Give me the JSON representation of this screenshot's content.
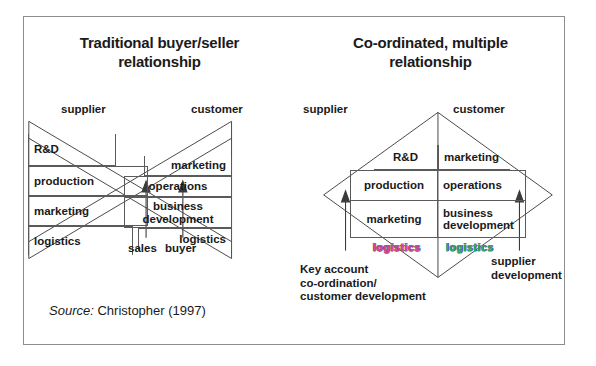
{
  "figure": {
    "source_label": "Source:",
    "source_text": "Christopher (1997)"
  },
  "left_panel": {
    "title": "Traditional buyer/seller relationship",
    "title_line1": "Traditional buyer/seller",
    "title_line2": "relationship",
    "supplier_label": "supplier",
    "customer_label": "customer",
    "supplier_functions": [
      "R&D",
      "production",
      "marketing",
      "logistics"
    ],
    "customer_functions": [
      "marketing",
      "operations",
      "business development",
      "logistics"
    ],
    "customer_function_3_line1": "business",
    "customer_function_3_line2": "development",
    "arrows": [
      {
        "label": "sales"
      },
      {
        "label": "buyer"
      }
    ]
  },
  "right_panel": {
    "title": "Co-ordinated, multiple relationship",
    "title_line1": "Co-ordinated, multiple",
    "title_line2": "relationship",
    "supplier_label": "supplier",
    "customer_label": "customer",
    "supplier_functions": [
      "R&D",
      "production",
      "marketing",
      "logistics"
    ],
    "customer_functions": [
      "marketing",
      "operations",
      "business development",
      "logistics"
    ],
    "customer_function_3_line1": "business",
    "customer_function_3_line2": "development",
    "supplier_logistics": "logistics",
    "customer_logistics": "logistics",
    "arrows": [
      {
        "label_line1": "Key account",
        "label_line2": "co-ordination/",
        "label_line3": "customer development"
      },
      {
        "label_line1": "supplier",
        "label_line2": "development"
      }
    ]
  },
  "colors": {
    "frame_border": "#8d8d8d",
    "line": "#4a4a4a",
    "text": "#1a1a1a",
    "logistics_magenta": "#d73a8c",
    "logistics_green": "#1fa84a"
  }
}
